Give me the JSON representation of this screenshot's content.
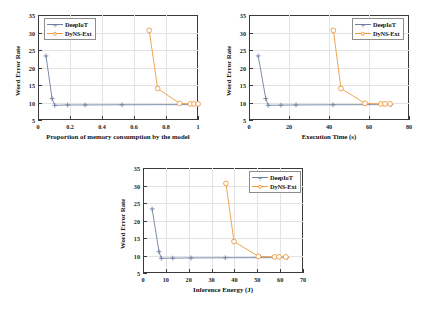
{
  "figure": {
    "series_colors": {
      "deepiot": "#6F7FA2",
      "dyns": "#ED9B3E"
    },
    "legend_labels": {
      "deepiot": "DeepIoT",
      "dyns": "DyNS-Ext"
    }
  },
  "chart_data": [
    {
      "id": "memory",
      "type": "line",
      "title": "",
      "xlabel": "Proportion of memory consumption by the model",
      "ylabel": "Word Error Rate",
      "xlim": [
        0,
        1
      ],
      "ylim": [
        5,
        35
      ],
      "xticks": [
        "0",
        "0.2",
        "0.4",
        "0.6",
        "0.8",
        "1"
      ],
      "xtickvals": [
        0,
        0.2,
        0.4,
        0.6,
        0.8,
        1
      ],
      "yticks": [
        "5",
        "10",
        "15",
        "20",
        "25",
        "30",
        "35"
      ],
      "ytickvals": [
        5,
        10,
        15,
        20,
        25,
        30,
        35
      ],
      "grid": true,
      "legend_position": "top-left",
      "series": [
        {
          "name": "DeepIoT",
          "marker": "plus",
          "x": [
            0.05,
            0.088,
            0.105,
            0.185,
            0.295,
            0.525,
            1.0
          ],
          "y": [
            23.3,
            11.1,
            9.2,
            9.3,
            9.3,
            9.35,
            9.4
          ]
        },
        {
          "name": "DyNS-Ext",
          "marker": "circle",
          "x": [
            0.695,
            0.748,
            0.885,
            0.952,
            0.975,
            1.0
          ],
          "y": [
            30.6,
            14.0,
            9.75,
            9.6,
            9.6,
            9.6
          ]
        }
      ]
    },
    {
      "id": "execution",
      "type": "line",
      "title": "",
      "xlabel": "Execution Time (s)",
      "ylabel": "Word Error Rate",
      "xlim": [
        0,
        80
      ],
      "ylim": [
        5,
        35
      ],
      "xticks": [
        "0",
        "20",
        "40",
        "60",
        "80"
      ],
      "xtickvals": [
        0,
        20,
        40,
        60,
        80
      ],
      "yticks": [
        "5",
        "10",
        "15",
        "20",
        "25",
        "30",
        "35"
      ],
      "ytickvals": [
        5,
        10,
        15,
        20,
        25,
        30,
        35
      ],
      "grid": true,
      "legend_position": "top-right",
      "series": [
        {
          "name": "DeepIoT",
          "marker": "plus",
          "x": [
            4.6,
            8.4,
            9.6,
            16.0,
            23.5,
            42.0,
            71.0
          ],
          "y": [
            23.3,
            11.1,
            9.2,
            9.25,
            9.3,
            9.35,
            9.4
          ]
        },
        {
          "name": "DyNS-Ext",
          "marker": "circle",
          "x": [
            42.2,
            46.0,
            58.0,
            66.0,
            68.0,
            70.5
          ],
          "y": [
            30.6,
            14.0,
            9.75,
            9.6,
            9.6,
            9.6
          ]
        }
      ]
    },
    {
      "id": "energy",
      "type": "line",
      "title": "",
      "xlabel": "Inference Energy (J)",
      "ylabel": "Word Error Rate",
      "xlim": [
        0,
        70
      ],
      "ylim": [
        5,
        35
      ],
      "xticks": [
        "0",
        "10",
        "20",
        "30",
        "40",
        "50",
        "60",
        "70"
      ],
      "xtickvals": [
        0,
        10,
        20,
        30,
        40,
        50,
        60,
        70
      ],
      "yticks": [
        "5",
        "10",
        "15",
        "20",
        "25",
        "30",
        "35"
      ],
      "ytickvals": [
        5,
        10,
        15,
        20,
        25,
        30,
        35
      ],
      "grid": true,
      "legend_position": "top-right",
      "series": [
        {
          "name": "DeepIoT",
          "marker": "plus",
          "x": [
            4.0,
            7.0,
            8.0,
            13.0,
            21.0,
            36.0,
            63.0
          ],
          "y": [
            23.3,
            11.1,
            9.2,
            9.25,
            9.3,
            9.35,
            9.4
          ]
        },
        {
          "name": "DyNS-Ext",
          "marker": "circle",
          "x": [
            36.3,
            39.8,
            50.5,
            57.5,
            59.5,
            62.5
          ],
          "y": [
            30.6,
            14.0,
            9.75,
            9.6,
            9.6,
            9.6
          ]
        }
      ]
    }
  ]
}
